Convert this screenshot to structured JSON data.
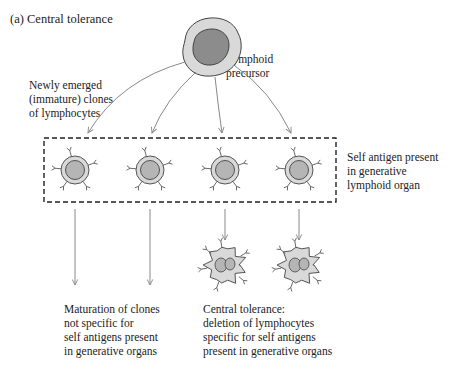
{
  "title": "(a) Central tolerance",
  "labels": {
    "precursor": [
      "Lymphoid",
      "precursor"
    ],
    "immature_clones": [
      "Newly emerged",
      "(immature) clones",
      "of lymphocytes"
    ],
    "self_antigen": [
      "Self antigen present",
      "in generative",
      "lymphoid organ"
    ],
    "maturation": [
      "Maturation of clones",
      "not specific for",
      "self antigens present",
      "in generative organs"
    ],
    "deletion": [
      "Central tolerance:",
      "deletion of lymphocytes",
      "specific for self antigens",
      "present in generative organs"
    ]
  },
  "cells": {
    "precursor_count": 1,
    "immature_count": 4,
    "surviving_count": 2,
    "deleted_count": 2
  },
  "colors": {
    "outer_cell": "#d9d9d9",
    "nucleus_precursor": "#8c8c8c",
    "nucleus_clone": "#b5b5b5",
    "outline": "#444444",
    "arrow": "#888888"
  }
}
